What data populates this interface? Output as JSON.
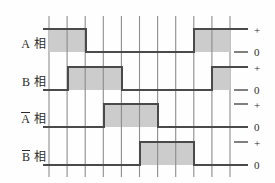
{
  "figure": {
    "type": "timing-diagram",
    "title": "",
    "background": "#fefefe",
    "fill_color": "#c9c9c9",
    "wave_line_color": "#4a4a4a",
    "grid_color": "#8d8d8d",
    "plot": {
      "x0": 49,
      "x1": 230,
      "grid_step": 18.1,
      "grid_count": 11
    },
    "rows": [
      {
        "label_sym": "A",
        "label_overline": false,
        "label_kanji": "相",
        "name": "a-phase",
        "baseline_y": 52,
        "high_y": 29,
        "label_y": 34,
        "level_high_label": "+",
        "level_low_label": "0",
        "level_high_label_y": 24,
        "level_low_label_y": 46,
        "pulses": [
          {
            "start": 49,
            "end": 86
          },
          {
            "start": 194,
            "end": 230
          }
        ]
      },
      {
        "label_sym": "B",
        "label_overline": false,
        "label_kanji": "相",
        "name": "b-phase",
        "baseline_y": 90,
        "high_y": 67,
        "label_y": 72,
        "level_high_label": "+",
        "level_low_label": "0",
        "level_high_label_y": 62,
        "level_low_label_y": 84,
        "pulses": [
          {
            "start": 68,
            "end": 122
          },
          {
            "start": 212,
            "end": 230
          }
        ]
      },
      {
        "label_sym": "A",
        "label_overline": true,
        "label_kanji": "相",
        "name": "a-bar-phase",
        "baseline_y": 127,
        "high_y": 104,
        "label_y": 109,
        "level_high_label": "+",
        "level_low_label": "0",
        "level_high_label_y": 99,
        "level_low_label_y": 121,
        "pulses": [
          {
            "start": 104,
            "end": 158
          }
        ]
      },
      {
        "label_sym": "B",
        "label_overline": true,
        "label_kanji": "相",
        "name": "b-bar-phase",
        "baseline_y": 165,
        "high_y": 142,
        "label_y": 147,
        "level_high_label": "+",
        "level_low_label": "0",
        "level_high_label_y": 137,
        "level_low_label_y": 159,
        "pulses": [
          {
            "start": 140,
            "end": 194
          }
        ]
      }
    ]
  },
  "chart_data": {
    "type": "line",
    "title": "",
    "xlabel": "",
    "ylabel": "",
    "x": [
      0,
      1,
      2,
      3,
      4,
      5,
      6,
      7,
      8,
      9,
      10
    ],
    "grid": true,
    "legend_position": "right",
    "series": [
      {
        "name": "A 相",
        "values": [
          1,
          1,
          0,
          0,
          0,
          0,
          0,
          0,
          1,
          1,
          1
        ],
        "levels": [
          "0",
          "+"
        ]
      },
      {
        "name": "B 相",
        "values": [
          0,
          1,
          1,
          1,
          0,
          0,
          0,
          0,
          0,
          0,
          1
        ],
        "levels": [
          "0",
          "+"
        ]
      },
      {
        "name": "Ā 相",
        "values": [
          0,
          0,
          0,
          1,
          1,
          1,
          0,
          0,
          0,
          0,
          0
        ],
        "levels": [
          "0",
          "+"
        ]
      },
      {
        "name": "B̄ 相",
        "values": [
          0,
          0,
          0,
          0,
          0,
          1,
          1,
          1,
          0,
          0,
          0
        ],
        "levels": [
          "0",
          "+"
        ]
      }
    ]
  }
}
